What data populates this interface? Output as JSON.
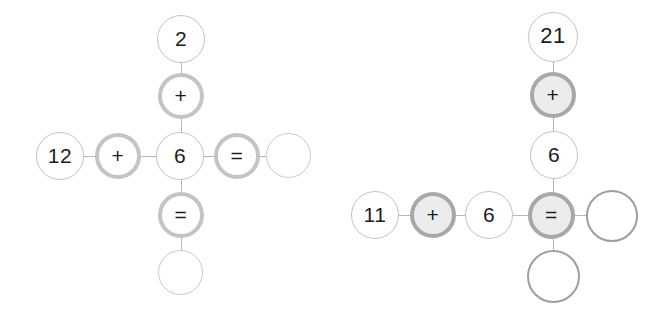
{
  "background_color": "#ffffff",
  "palette": {
    "value_outline": "#c3c3c3",
    "operator_ring": "#c4c4c4",
    "operator_ring_dark": "#a8a8a8",
    "operator_fill": "#ececec",
    "empty_outline_light": "#c9c9c9",
    "empty_outline_dark": "#9e9e9e",
    "edge": "#b6b6b6",
    "text": "#1c1c1c"
  },
  "puzzles": [
    {
      "id": "left-puzzle",
      "name": "cross-equation-left",
      "layout": "cross",
      "horizontal_expression": "12 + 6 = ?",
      "vertical_expression": "2 + 6 = ?",
      "nodes": [
        {
          "id": "l-top-value",
          "name": "node-value-2",
          "label": "2",
          "kind": "value",
          "x": 157,
          "y": 15,
          "size": 48,
          "font_size": 21
        },
        {
          "id": "l-top-op",
          "name": "node-operator-plus",
          "label": "+",
          "kind": "op-ring",
          "x": 158,
          "y": 73,
          "size": 46,
          "font_size": 21
        },
        {
          "id": "l-left-value",
          "name": "node-value-12",
          "label": "12",
          "kind": "value",
          "x": 36,
          "y": 132,
          "size": 48,
          "font_size": 21
        },
        {
          "id": "l-left-op",
          "name": "node-operator-plus",
          "label": "+",
          "kind": "op-ring",
          "x": 95,
          "y": 133,
          "size": 46,
          "font_size": 21
        },
        {
          "id": "l-center-value",
          "name": "node-value-6",
          "label": "6",
          "kind": "value",
          "x": 156,
          "y": 132,
          "size": 48,
          "font_size": 21
        },
        {
          "id": "l-right-op",
          "name": "node-operator-equals",
          "label": "=",
          "kind": "op-ring",
          "x": 214,
          "y": 133,
          "size": 46,
          "font_size": 21
        },
        {
          "id": "l-right-empty",
          "name": "node-empty-answer",
          "label": "",
          "kind": "empty-light",
          "x": 266,
          "y": 133,
          "size": 45,
          "font_size": 21
        },
        {
          "id": "l-bottom-op",
          "name": "node-operator-equals",
          "label": "=",
          "kind": "op-ring",
          "x": 158,
          "y": 192,
          "size": 46,
          "font_size": 21
        },
        {
          "id": "l-bottom-empty",
          "name": "node-empty-answer",
          "label": "",
          "kind": "empty-light",
          "x": 158,
          "y": 250,
          "size": 45,
          "font_size": 21
        }
      ],
      "edges": [
        {
          "name": "edge-2-to-plus",
          "orient": "v",
          "x": 181,
          "y": 62,
          "len": 12
        },
        {
          "name": "edge-plus-to-6",
          "orient": "v",
          "x": 181,
          "y": 119,
          "len": 14
        },
        {
          "name": "edge-12-to-plus",
          "orient": "h",
          "x": 84,
          "y": 156,
          "len": 12
        },
        {
          "name": "edge-plus-to-6-h",
          "orient": "h",
          "x": 141,
          "y": 156,
          "len": 15
        },
        {
          "name": "edge-6-to-equals",
          "orient": "h",
          "x": 204,
          "y": 156,
          "len": 11
        },
        {
          "name": "edge-equals-to-empty",
          "orient": "h",
          "x": 260,
          "y": 156,
          "len": 7
        },
        {
          "name": "edge-6-to-equals-v",
          "orient": "v",
          "x": 181,
          "y": 180,
          "len": 13
        },
        {
          "name": "edge-equals-to-empty-v",
          "orient": "v",
          "x": 181,
          "y": 238,
          "len": 13
        }
      ]
    },
    {
      "id": "right-puzzle",
      "name": "cross-equation-right",
      "layout": "cross",
      "horizontal_expression": "11 + 6 = ?",
      "vertical_expression": "21 + 6 = ?",
      "nodes": [
        {
          "id": "r-top-value",
          "name": "node-value-21",
          "label": "21",
          "kind": "value",
          "x": 528,
          "y": 12,
          "size": 50,
          "font_size": 22
        },
        {
          "id": "r-top-op",
          "name": "node-operator-plus",
          "label": "+",
          "kind": "op-fill",
          "x": 530,
          "y": 72,
          "size": 46,
          "font_size": 21
        },
        {
          "id": "r-mid-value",
          "name": "node-value-6",
          "label": "6",
          "kind": "value",
          "x": 530,
          "y": 131,
          "size": 48,
          "font_size": 21
        },
        {
          "id": "r-left-value",
          "name": "node-value-11",
          "label": "11",
          "kind": "value",
          "x": 351,
          "y": 191,
          "size": 48,
          "font_size": 21
        },
        {
          "id": "r-left-op",
          "name": "node-operator-plus",
          "label": "+",
          "kind": "op-fill",
          "x": 410,
          "y": 192,
          "size": 46,
          "font_size": 21
        },
        {
          "id": "r-center-value",
          "name": "node-value-6",
          "label": "6",
          "kind": "value",
          "x": 465,
          "y": 191,
          "size": 48,
          "font_size": 21
        },
        {
          "id": "r-center-op",
          "name": "node-operator-equals",
          "label": "=",
          "kind": "op-fill",
          "x": 528,
          "y": 192,
          "size": 47,
          "font_size": 21
        },
        {
          "id": "r-right-empty",
          "name": "node-empty-answer",
          "label": "",
          "kind": "empty-dark",
          "x": 586,
          "y": 190,
          "size": 52,
          "font_size": 21
        },
        {
          "id": "r-bottom-empty",
          "name": "node-empty-answer",
          "label": "",
          "kind": "empty-dark",
          "x": 527,
          "y": 250,
          "size": 53,
          "font_size": 21
        }
      ],
      "edges": [
        {
          "name": "edge-21-to-plus",
          "orient": "v",
          "x": 553,
          "y": 61,
          "len": 12
        },
        {
          "name": "edge-plus-to-6",
          "orient": "v",
          "x": 553,
          "y": 117,
          "len": 15
        },
        {
          "name": "edge-6-to-equals",
          "orient": "v",
          "x": 553,
          "y": 178,
          "len": 15
        },
        {
          "name": "edge-11-to-plus",
          "orient": "h",
          "x": 399,
          "y": 215,
          "len": 12
        },
        {
          "name": "edge-plus-to-6-h",
          "orient": "h",
          "x": 456,
          "y": 215,
          "len": 10
        },
        {
          "name": "edge-6-to-equals-h",
          "orient": "h",
          "x": 513,
          "y": 215,
          "len": 16
        },
        {
          "name": "edge-equals-to-empty",
          "orient": "h",
          "x": 575,
          "y": 215,
          "len": 12
        },
        {
          "name": "edge-equals-to-empty-v",
          "orient": "v",
          "x": 553,
          "y": 238,
          "len": 13
        }
      ]
    }
  ]
}
